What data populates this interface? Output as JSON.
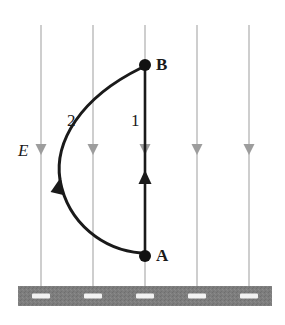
{
  "figure": {
    "background_color": "#ffffff"
  },
  "field": {
    "label": "E",
    "label_x": 18,
    "label_y": 142,
    "direction": "down",
    "line_color": "#c2c2c2",
    "arrow_color": "#9d9d9d",
    "line_top_y": 25,
    "line_bottom_y": 286,
    "arrow_y": 155,
    "line_x_positions": [
      41,
      93,
      145,
      197,
      249
    ]
  },
  "points": [
    {
      "id": "point-b",
      "label": "B",
      "x": 145,
      "y": 65,
      "label_x": 156,
      "label_y": 56,
      "dot_radius": 6,
      "color": "#111111"
    },
    {
      "id": "point-a",
      "label": "A",
      "x": 145,
      "y": 256,
      "label_x": 156,
      "label_y": 247,
      "dot_radius": 6,
      "color": "#111111"
    }
  ],
  "paths": [
    {
      "id": "path-1",
      "label": "1",
      "label_x": 131,
      "label_y": 112,
      "shape": "straight",
      "from": "A",
      "to": "B",
      "arrow_direction": "up",
      "arrow_x": 145,
      "arrow_y": 170,
      "color": "#1a1a1a",
      "stroke_width": 2.6,
      "d": "M 145 252 L 145 69"
    },
    {
      "id": "path-2",
      "label": "2",
      "label_x": 67,
      "label_y": 112,
      "shape": "curved",
      "from": "A",
      "to": "B",
      "arrow_direction": "up",
      "arrow_x": 61,
      "arrow_y": 177,
      "color": "#1a1a1a",
      "stroke_width": 3.0,
      "d": "M 141 253 C 104 250 68 224 60 180 C 54 142 80 98 141 68"
    }
  ],
  "ground": {
    "label": "hatched ground bar",
    "x": 18,
    "y": 286,
    "width": 254,
    "height": 20,
    "fill_color": "#7d7d7d",
    "dash_color": "#f2f2f2",
    "dash_width": 18,
    "dash_height": 5,
    "dash_x_positions": [
      41,
      93,
      145,
      197,
      249
    ]
  }
}
